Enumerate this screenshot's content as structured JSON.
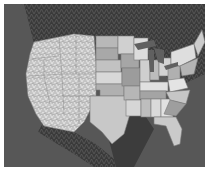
{
  "map": {
    "type": "shaded-relief map",
    "region": "Contiguous United States",
    "style": "grayscale",
    "colors": {
      "background": "#ffffff",
      "ocean": "#555555",
      "canada": "#4a4a4a",
      "mexico": "#3e3e3e",
      "lakes": "#6a6a6a",
      "border": "#7a7a7a",
      "west_relief": "#c8c8c8",
      "state_light": "#d4d4d4",
      "state_mid": "#b4b4b4",
      "state_dark": "#9a9a9a"
    }
  }
}
